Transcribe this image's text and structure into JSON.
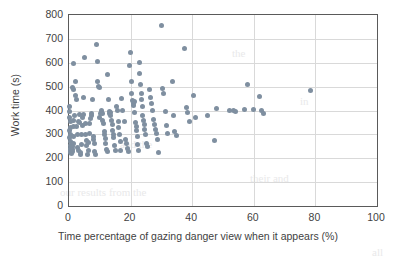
{
  "chart_data": {
    "type": "scatter",
    "title": "",
    "xlabel": "Time percentage of gazing danger view when it appears (%)",
    "ylabel": "Work time (s)",
    "xlim": [
      0,
      100
    ],
    "ylim": [
      0,
      800
    ],
    "xticks": [
      0,
      20,
      40,
      60,
      80,
      100
    ],
    "yticks": [
      0,
      100,
      200,
      300,
      400,
      500,
      600,
      700,
      800
    ],
    "grid": "both",
    "legend": "none",
    "marker_color": "#7f8fa0",
    "series": [
      {
        "name": "observations",
        "points": [
          [
            0.2,
            415
          ],
          [
            0.3,
            395
          ],
          [
            0.3,
            370
          ],
          [
            0.4,
            352
          ],
          [
            0.4,
            330
          ],
          [
            0.3,
            318
          ],
          [
            0.4,
            300
          ],
          [
            0.3,
            288
          ],
          [
            0.5,
            272
          ],
          [
            0.4,
            255
          ],
          [
            0.5,
            240
          ],
          [
            0.6,
            232
          ],
          [
            0.4,
            224
          ],
          [
            0.7,
            218
          ],
          [
            1.0,
            248
          ],
          [
            1.1,
            236
          ],
          [
            1.2,
            228
          ],
          [
            1.3,
            262
          ],
          [
            1.4,
            292
          ],
          [
            1.5,
            333
          ],
          [
            1.6,
            358
          ],
          [
            1.8,
            378
          ],
          [
            1.2,
            496
          ],
          [
            1.5,
            490
          ],
          [
            1.3,
            595
          ],
          [
            2.0,
            520
          ],
          [
            2.2,
            463
          ],
          [
            2.4,
            448
          ],
          [
            2.5,
            332
          ],
          [
            2.6,
            300
          ],
          [
            2.8,
            243
          ],
          [
            3.0,
            232
          ],
          [
            3.2,
            355
          ],
          [
            3.4,
            382
          ],
          [
            3.5,
            348
          ],
          [
            3.6,
            214
          ],
          [
            3.8,
            222
          ],
          [
            4.0,
            258
          ],
          [
            4.2,
            300
          ],
          [
            4.3,
            338
          ],
          [
            4.5,
            372
          ],
          [
            4.6,
            385
          ],
          [
            4.8,
            455
          ],
          [
            5.0,
            620
          ],
          [
            5.2,
            344
          ],
          [
            5.4,
            298
          ],
          [
            5.6,
            276
          ],
          [
            5.8,
            252
          ],
          [
            6.0,
            215
          ],
          [
            6.2,
            232
          ],
          [
            6.4,
            266
          ],
          [
            6.6,
            302
          ],
          [
            6.8,
            346
          ],
          [
            7.0,
            368
          ],
          [
            7.2,
            380
          ],
          [
            7.4,
            388
          ],
          [
            7.6,
            445
          ],
          [
            7.8,
            292
          ],
          [
            8.0,
            280
          ],
          [
            8.2,
            262
          ],
          [
            8.4,
            230
          ],
          [
            8.6,
            216
          ],
          [
            9.0,
            677
          ],
          [
            9.2,
            605
          ],
          [
            9.4,
            522
          ],
          [
            9.6,
            500
          ],
          [
            9.8,
            496
          ],
          [
            10.0,
            370
          ],
          [
            10.2,
            386
          ],
          [
            10.4,
            392
          ],
          [
            10.6,
            398
          ],
          [
            10.8,
            388
          ],
          [
            11.0,
            360
          ],
          [
            11.2,
            344
          ],
          [
            11.4,
            312
          ],
          [
            11.6,
            298
          ],
          [
            11.8,
            284
          ],
          [
            12.0,
            262
          ],
          [
            12.2,
            238
          ],
          [
            12.4,
            228
          ],
          [
            12.6,
            550
          ],
          [
            12.8,
            448
          ],
          [
            13.0,
            396
          ],
          [
            13.2,
            386
          ],
          [
            13.4,
            392
          ],
          [
            13.6,
            378
          ],
          [
            13.8,
            360
          ],
          [
            14.0,
            340
          ],
          [
            14.2,
            318
          ],
          [
            14.4,
            300
          ],
          [
            14.6,
            288
          ],
          [
            14.8,
            254
          ],
          [
            15.0,
            232
          ],
          [
            15.5,
            415
          ],
          [
            15.8,
            400
          ],
          [
            16.0,
            352
          ],
          [
            16.2,
            330
          ],
          [
            16.4,
            300
          ],
          [
            16.6,
            272
          ],
          [
            16.8,
            234
          ],
          [
            17.0,
            450
          ],
          [
            17.4,
            398
          ],
          [
            18.0,
            355
          ],
          [
            18.4,
            278
          ],
          [
            18.8,
            262
          ],
          [
            19.0,
            240
          ],
          [
            19.4,
            228
          ],
          [
            19.8,
            590
          ],
          [
            20.0,
            645
          ],
          [
            20.2,
            520
          ],
          [
            20.4,
            470
          ],
          [
            20.6,
            440
          ],
          [
            20.8,
            428
          ],
          [
            21.0,
            422
          ],
          [
            21.2,
            438
          ],
          [
            21.4,
            392
          ],
          [
            21.6,
            350
          ],
          [
            21.8,
            332
          ],
          [
            22.0,
            318
          ],
          [
            22.2,
            292
          ],
          [
            22.4,
            256
          ],
          [
            22.6,
            234
          ],
          [
            22.8,
            600
          ],
          [
            23.0,
            553
          ],
          [
            23.2,
            507
          ],
          [
            23.4,
            470
          ],
          [
            23.6,
            444
          ],
          [
            23.8,
            415
          ],
          [
            24.0,
            380
          ],
          [
            24.2,
            358
          ],
          [
            24.4,
            342
          ],
          [
            24.6,
            322
          ],
          [
            24.8,
            300
          ],
          [
            25.0,
            262
          ],
          [
            25.4,
            248
          ],
          [
            26.0,
            487
          ],
          [
            26.4,
            455
          ],
          [
            26.8,
            430
          ],
          [
            27.0,
            398
          ],
          [
            27.4,
            362
          ],
          [
            27.8,
            340
          ],
          [
            28.0,
            320
          ],
          [
            28.4,
            304
          ],
          [
            28.8,
            280
          ],
          [
            29.0,
            226
          ],
          [
            30.0,
            755
          ],
          [
            30.4,
            492
          ],
          [
            30.8,
            470
          ],
          [
            31.2,
            396
          ],
          [
            31.6,
            338
          ],
          [
            32.0,
            302
          ],
          [
            33.6,
            520
          ],
          [
            34.0,
            380
          ],
          [
            34.4,
            312
          ],
          [
            35.0,
            294
          ],
          [
            37.4,
            658
          ],
          [
            38.0,
            412
          ],
          [
            38.4,
            392
          ],
          [
            39.0,
            355
          ],
          [
            40.4,
            462
          ],
          [
            41.0,
            372
          ],
          [
            45.0,
            380
          ],
          [
            47.4,
            276
          ],
          [
            48.0,
            408
          ],
          [
            52.0,
            398
          ],
          [
            53.4,
            400
          ],
          [
            54.0,
            396
          ],
          [
            57.0,
            404
          ],
          [
            58.0,
            510
          ],
          [
            60.0,
            404
          ],
          [
            62.0,
            458
          ],
          [
            62.6,
            400
          ],
          [
            63.0,
            388
          ],
          [
            78.4,
            484
          ]
        ]
      }
    ]
  },
  "axis": {
    "y_labels": [
      "800",
      "700",
      "600",
      "500",
      "400",
      "300",
      "200",
      "100",
      "0"
    ],
    "x_labels": [
      "0",
      "20",
      "40",
      "60",
      "80",
      "100"
    ],
    "y_title": "Work time (s)",
    "x_title": "Time percentage of gazing danger view when it appears (%)"
  },
  "background_text": {
    "lines": [
      "the",
      "and the",
      "in",
      "our results from the",
      "their and",
      "all"
    ]
  }
}
